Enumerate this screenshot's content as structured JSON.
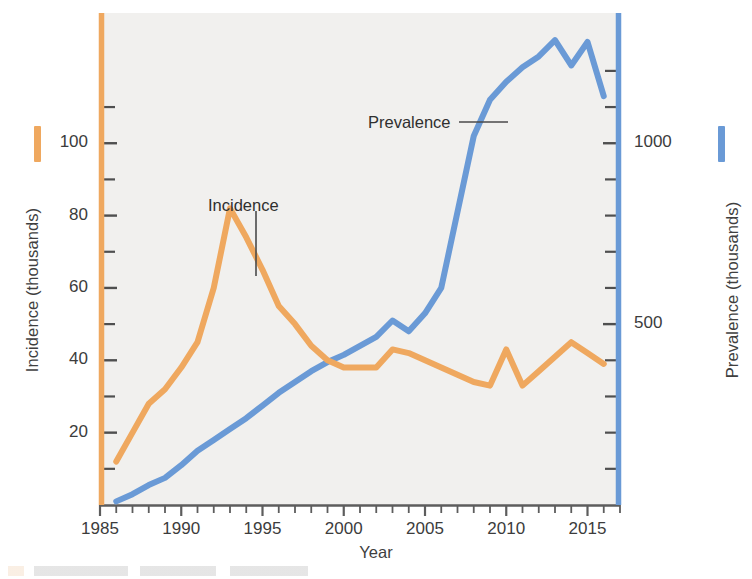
{
  "figure": {
    "background_color": "#f1f0ee",
    "plot_area": {
      "left": 100,
      "right": 620,
      "top": 13,
      "bottom": 505
    }
  },
  "axes": {
    "x": {
      "title": "Year",
      "tick_labels": [
        "1985",
        "1990",
        "1995",
        "2000",
        "2005",
        "2010",
        "2015"
      ],
      "tick_values": [
        1985,
        1990,
        1995,
        2000,
        2005,
        2010,
        2015
      ],
      "range": [
        1985,
        2017
      ],
      "minor_tick_interval": 1
    },
    "y_left": {
      "title": "Incidence (thousands)",
      "tick_labels": [
        "20",
        "40",
        "60",
        "80",
        "100"
      ],
      "tick_values": [
        20,
        40,
        60,
        80,
        100
      ],
      "range": [
        0,
        136
      ],
      "minor_tick_values": [
        10,
        30,
        50,
        70,
        90,
        110
      ],
      "color": "#efa85f"
    },
    "y_right": {
      "title": "Prevalence (thousands)",
      "tick_labels": [
        "500",
        "1000"
      ],
      "tick_values": [
        500,
        1000
      ],
      "range": [
        0,
        1360
      ],
      "minor_tick_values": [
        100,
        200,
        300,
        400,
        600,
        700,
        800,
        900,
        1100,
        1200
      ],
      "color": "#6a9ad6"
    }
  },
  "annotations": [
    {
      "name": "incidence-label",
      "text": "Incidence",
      "x_px": 208,
      "y_px": 196,
      "leader": "vertical"
    },
    {
      "name": "prevalence-label",
      "text": "Prevalence",
      "x_px": 368,
      "y_px": 113,
      "leader": "horizontal"
    }
  ],
  "legend": {
    "incidence_color": "#efa85f",
    "prevalence_color": "#6a9ad6"
  },
  "chart_data": {
    "type": "line",
    "title": "",
    "xlabel": "Year",
    "ylabel": "Incidence (thousands)",
    "y2label": "Prevalence (thousands)",
    "xlim": [
      1985,
      2017
    ],
    "ylim": [
      0,
      136
    ],
    "y2lim": [
      0,
      1360
    ],
    "grid": false,
    "legend_position": "inline-annotations",
    "x": [
      1986,
      1987,
      1988,
      1989,
      1990,
      1991,
      1992,
      1993,
      1994,
      1995,
      1996,
      1997,
      1998,
      1999,
      2000,
      2001,
      2002,
      2003,
      2004,
      2005,
      2006,
      2007,
      2008,
      2009,
      2010,
      2011,
      2012,
      2013,
      2014,
      2015,
      2016
    ],
    "series": [
      {
        "name": "Incidence",
        "axis": "left",
        "units": "thousands",
        "color": "#efa85f",
        "values": [
          12,
          20,
          28,
          32,
          38,
          45,
          60,
          82,
          74,
          65,
          55,
          50,
          44,
          40,
          38,
          38,
          38,
          43,
          42,
          40,
          38,
          36,
          34,
          33,
          43,
          33,
          37,
          41,
          45,
          42,
          39
        ]
      },
      {
        "name": "Prevalence",
        "axis": "right",
        "units": "thousands",
        "color": "#6a9ad6",
        "values": [
          10,
          30,
          55,
          75,
          110,
          150,
          180,
          210,
          240,
          275,
          310,
          340,
          370,
          395,
          415,
          440,
          465,
          510,
          480,
          530,
          600,
          810,
          1020,
          1120,
          1170,
          1210,
          1240,
          1285,
          1215,
          1280,
          1130
        ]
      }
    ]
  }
}
